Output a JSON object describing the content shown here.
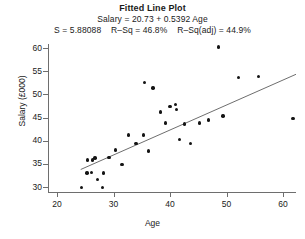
{
  "chart_data": {
    "type": "scatter",
    "title": "Fitted Line Plot",
    "subtitle": "Salary = 20.73 + 0.5392 Age",
    "stats_line": "S = 5.88088    R–Sq = 46.8%    R–Sq(adj) = 44.9%",
    "stats": {
      "s_label": "S",
      "s_value": "5.88088",
      "rsq_label": "R–Sq",
      "rsq_value": "46.8%",
      "rsq_adj_label": "R–Sq(adj)",
      "rsq_adj_value": "44.9%"
    },
    "regression": {
      "intercept": 20.73,
      "slope": 0.5392,
      "equation": "Salary = 20.73 + 0.5392 Age",
      "x_start": 24.2,
      "x_end": 62.3
    },
    "xlabel": "Age",
    "ylabel": "Salary (£000)",
    "xlim": [
      18.5,
      62.8
    ],
    "ylim": [
      28.8,
      61.4
    ],
    "xticks": [
      20,
      30,
      40,
      50,
      60
    ],
    "yticks": [
      30,
      35,
      40,
      45,
      50,
      55,
      60
    ],
    "grid": false,
    "legend": "none",
    "x": [
      24.3,
      25.3,
      25.4,
      26.1,
      26.3,
      26.7,
      27.2,
      28.0,
      28.2,
      29.2,
      30.3,
      31.5,
      32.6,
      34.0,
      35.3,
      35.5,
      36.2,
      37.0,
      38.3,
      39.2,
      40.0,
      41.0,
      41.2,
      41.7,
      42.6,
      43.6,
      45.2,
      46.8,
      48.6,
      49.4,
      52.1,
      55.7,
      61.8
    ],
    "y": [
      29.9,
      33.0,
      35.8,
      33.1,
      35.8,
      36.3,
      31.6,
      29.9,
      33.0,
      36.4,
      38.0,
      34.9,
      41.2,
      39.4,
      41.2,
      52.5,
      37.8,
      51.4,
      46.2,
      43.8,
      47.4,
      47.8,
      46.7,
      40.2,
      43.6,
      39.4,
      43.8,
      44.5,
      60.2,
      45.3,
      53.6,
      53.9,
      44.8
    ],
    "points": [
      {
        "x": 24.3,
        "y": 29.9
      },
      {
        "x": 25.3,
        "y": 33.0
      },
      {
        "x": 25.4,
        "y": 35.8
      },
      {
        "x": 26.1,
        "y": 33.1
      },
      {
        "x": 26.3,
        "y": 35.8
      },
      {
        "x": 26.7,
        "y": 36.3
      },
      {
        "x": 27.2,
        "y": 31.6
      },
      {
        "x": 28.0,
        "y": 29.9
      },
      {
        "x": 28.2,
        "y": 33.0
      },
      {
        "x": 29.2,
        "y": 36.4
      },
      {
        "x": 30.3,
        "y": 38.0
      },
      {
        "x": 31.5,
        "y": 34.9
      },
      {
        "x": 32.6,
        "y": 41.2
      },
      {
        "x": 34.0,
        "y": 39.4
      },
      {
        "x": 35.3,
        "y": 41.2
      },
      {
        "x": 35.5,
        "y": 52.5
      },
      {
        "x": 36.2,
        "y": 37.8
      },
      {
        "x": 37.0,
        "y": 51.4
      },
      {
        "x": 38.3,
        "y": 46.2
      },
      {
        "x": 39.2,
        "y": 43.8
      },
      {
        "x": 40.0,
        "y": 47.4
      },
      {
        "x": 41.0,
        "y": 47.8
      },
      {
        "x": 41.2,
        "y": 46.7
      },
      {
        "x": 41.7,
        "y": 40.2
      },
      {
        "x": 42.6,
        "y": 43.6
      },
      {
        "x": 43.6,
        "y": 39.4
      },
      {
        "x": 45.2,
        "y": 43.8
      },
      {
        "x": 46.8,
        "y": 44.5
      },
      {
        "x": 48.6,
        "y": 60.2
      },
      {
        "x": 49.4,
        "y": 45.3
      },
      {
        "x": 52.1,
        "y": 53.6
      },
      {
        "x": 55.7,
        "y": 53.9
      },
      {
        "x": 61.8,
        "y": 44.8
      }
    ],
    "marker_color": "#141414",
    "line_color": "#6e6e6e",
    "axis_color": "#6e6e6e",
    "background": "#ffffff"
  }
}
